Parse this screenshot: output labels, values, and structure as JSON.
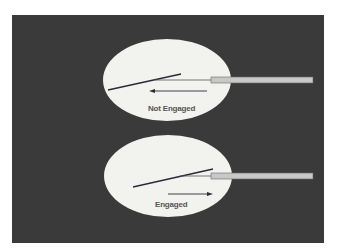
{
  "colors": {
    "background": "#ffffff",
    "panel": "#3a3a3a",
    "ellipse": "#f2f2ee",
    "rod_fill": "#c8c8c8",
    "line": "#2a2a3a"
  },
  "diagrams": [
    {
      "state": "not-engaged",
      "label": "Not Engaged",
      "arrow_direction": "left"
    },
    {
      "state": "engaged",
      "label": "Engaged",
      "arrow_direction": "right"
    }
  ]
}
